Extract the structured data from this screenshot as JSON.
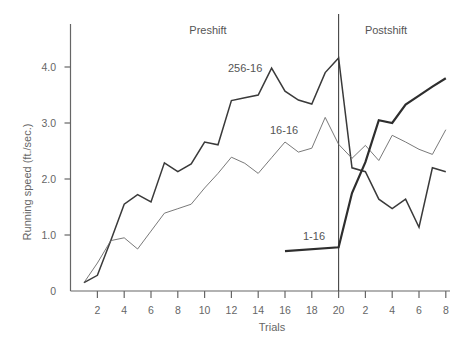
{
  "chart_data": {
    "type": "line",
    "title": "",
    "xlabel": "Trials",
    "ylabel": "Running speed (ft./sec.)",
    "ylim": [
      0,
      4.6
    ],
    "yticks": [
      0,
      1.0,
      2.0,
      3.0,
      4.0
    ],
    "ytick_labels": [
      "0",
      "1.0",
      "2.0",
      "3.0",
      "4.0"
    ],
    "xtick_labels": [
      "2",
      "4",
      "6",
      "8",
      "10",
      "12",
      "14",
      "16",
      "18",
      "20",
      "2",
      "4",
      "6",
      "8"
    ],
    "xtick_positions": [
      2,
      4,
      6,
      8,
      10,
      12,
      14,
      16,
      18,
      20,
      22,
      24,
      26,
      28
    ],
    "grid": false,
    "legend": "inline labels",
    "sections": [
      {
        "name": "Preshift",
        "x_range": [
          1,
          20
        ]
      },
      {
        "name": "Postshift",
        "x_range": [
          20,
          28
        ]
      }
    ],
    "shift_at": 20,
    "series": [
      {
        "name": "256-16",
        "style": "medium",
        "x": [
          1,
          2,
          3,
          4,
          5,
          6,
          7,
          8,
          9,
          10,
          11,
          12,
          13,
          14,
          15,
          16,
          17,
          18,
          19,
          20,
          21,
          22,
          23,
          24,
          25,
          26,
          27,
          28
        ],
        "values": [
          0.15,
          0.28,
          0.9,
          1.55,
          1.72,
          1.59,
          2.29,
          2.13,
          2.27,
          2.66,
          2.61,
          3.4,
          3.45,
          3.5,
          3.98,
          3.57,
          3.41,
          3.34,
          3.9,
          4.16,
          2.2,
          2.13,
          1.64,
          1.47,
          1.64,
          1.14,
          2.2,
          2.13
        ]
      },
      {
        "name": "16-16",
        "style": "thin",
        "x": [
          1,
          2,
          3,
          4,
          5,
          6,
          7,
          8,
          9,
          10,
          11,
          12,
          13,
          14,
          15,
          16,
          17,
          18,
          19,
          20,
          21,
          22,
          23,
          24,
          25,
          26,
          27,
          28
        ],
        "values": [
          0.15,
          0.5,
          0.9,
          0.95,
          0.75,
          1.07,
          1.39,
          1.47,
          1.55,
          1.84,
          2.1,
          2.39,
          2.28,
          2.1,
          2.38,
          2.66,
          2.48,
          2.55,
          3.1,
          2.62,
          2.37,
          2.6,
          2.33,
          2.78,
          2.66,
          2.53,
          2.44,
          2.88
        ]
      },
      {
        "name": "1-16",
        "style": "thick",
        "x": [
          16,
          20,
          21,
          22,
          23,
          24,
          25,
          26,
          27,
          28
        ],
        "values": [
          0.71,
          0.78,
          1.75,
          2.3,
          3.05,
          3.0,
          3.33,
          3.49,
          3.65,
          3.8
        ]
      }
    ],
    "labels": [
      {
        "text": "256-16",
        "series": "256-16"
      },
      {
        "text": "16-16",
        "series": "16-16"
      },
      {
        "text": "1-16",
        "series": "1-16"
      }
    ]
  },
  "sections": {
    "preshift": "Preshift",
    "postshift": "Postshift"
  },
  "axes": {
    "xlabel": "Trials",
    "ylabel": "Running speed (ft./sec.)"
  }
}
